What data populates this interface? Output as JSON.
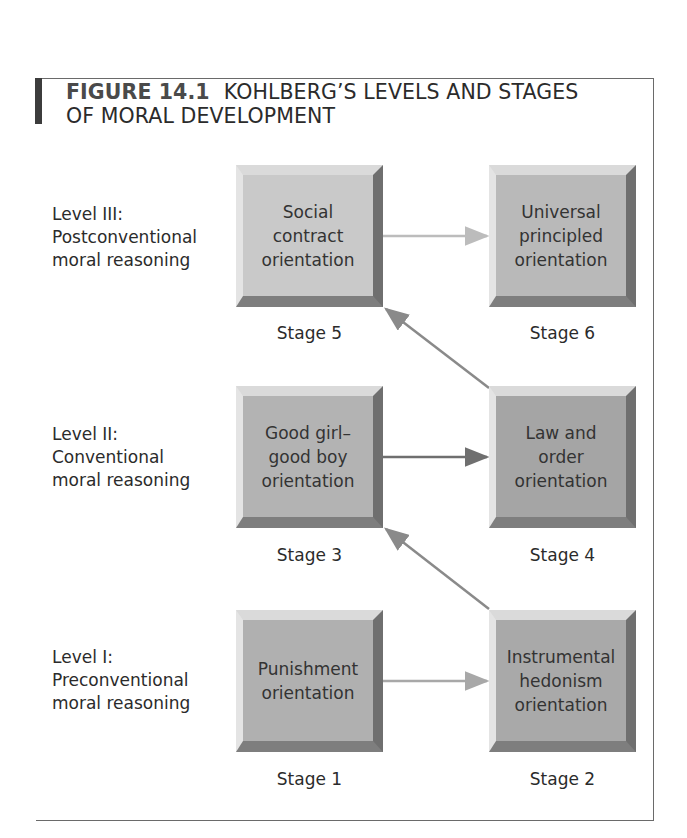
{
  "figure": {
    "number": "FIGURE 14.1",
    "title_line1": "KOHLBERG’S LEVELS AND STAGES",
    "title_line2": "OF MORAL DEVELOPMENT"
  },
  "levels": [
    {
      "line1": "Level III:",
      "line2": "Postconventional",
      "line3": "moral reasoning"
    },
    {
      "line1": "Level II:",
      "line2": "Conventional",
      "line3": "moral reasoning"
    },
    {
      "line1": "Level I:",
      "line2": "Preconventional",
      "line3": "moral reasoning"
    }
  ],
  "stages": {
    "s1": {
      "text": "Punishment\norientation",
      "label": "Stage 1",
      "color": "#b0b0b0"
    },
    "s2": {
      "text": "Instrumental\nhedonism\norientation",
      "label": "Stage 2",
      "color": "#a9a9a9"
    },
    "s3": {
      "text": "Good girl–\ngood boy\norientation",
      "label": "Stage 3",
      "color": "#b3b3b3"
    },
    "s4": {
      "text": "Law and\norder\norientation",
      "label": "Stage 4",
      "color": "#a5a5a5"
    },
    "s5": {
      "text": "Social\ncontract\norientation",
      "label": "Stage 5",
      "color": "#c9c9c9"
    },
    "s6": {
      "text": "Universal\nprincipled\norientation",
      "label": "Stage 6",
      "color": "#b9b9b9"
    }
  },
  "arrows": [
    {
      "from": "Stage 1",
      "to": "Stage 2",
      "color": "#a8a8a8"
    },
    {
      "from": "Stage 2",
      "to": "Stage 3",
      "color": "#8a8a8a"
    },
    {
      "from": "Stage 3",
      "to": "Stage 4",
      "color": "#6f6f6f"
    },
    {
      "from": "Stage 4",
      "to": "Stage 5",
      "color": "#8a8a8a"
    },
    {
      "from": "Stage 5",
      "to": "Stage 6",
      "color": "#bcbcbc"
    }
  ]
}
